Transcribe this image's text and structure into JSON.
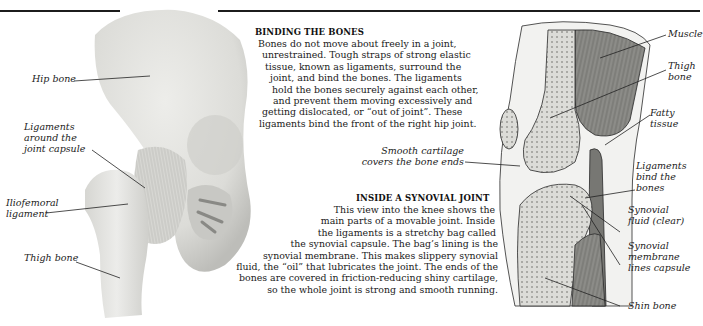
{
  "sections": {
    "binding": {
      "heading": "BINDING THE BONES",
      "lines": [
        "Bones do not move about freely in a joint,",
        "unrestrained. Tough straps of strong elastic",
        "tissue, known as ligaments, surround the",
        "joint, and bind the bones. The ligaments",
        "hold the bones securely against each other,",
        "and prevent them moving excessively and",
        "getting dislocated, or “out of joint”. These",
        "ligaments bind the front of the right hip joint."
      ]
    },
    "synovial": {
      "heading": "INSIDE A SYNOVIAL JOINT",
      "lines": [
        "This view into the knee shows the",
        "main parts of a movable joint. Inside",
        "the ligaments is a stretchy bag called",
        "the synovial capsule. The bag’s lining is the",
        "synovial membrane. This makes slippery synovial",
        "fluid, the “oil” that lubricates the joint. The ends of the",
        "bones are covered in friction-reducing shiny cartilage,",
        "so the whole joint is strong and smooth running."
      ]
    }
  },
  "hip_labels": {
    "hip_bone": "Hip bone",
    "ligaments_capsule": "Ligaments\naround the\njoint capsule",
    "iliofemoral": "Iliofemoral\nligament",
    "thigh_bone": "Thigh bone"
  },
  "knee_labels": {
    "cartilage": "Smooth cartilage\ncovers the bone ends",
    "muscle": "Muscle",
    "thigh_bone": "Thigh\nbone",
    "fatty_tissue": "Fatty\ntissue",
    "ligaments_bind": "Ligaments\nbind the bones",
    "synovial_fluid": "Synovial\nfluid (clear)",
    "synovial_membrane": "Synovial\nmembrane\nlines capsule",
    "shin_bone": "Shin bone"
  },
  "colors": {
    "bone": "#e6e6e3",
    "bone_shadow": "#c4c4c0",
    "muscle": "#8a8a86",
    "rule": "#1c1c1c"
  }
}
